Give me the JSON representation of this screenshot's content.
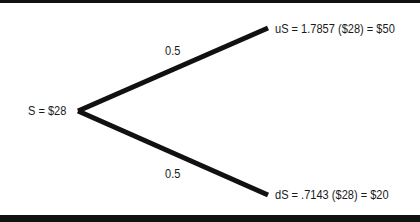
{
  "diagram": {
    "type": "binomial-tree",
    "root": {
      "label": "S = $28"
    },
    "branches": [
      {
        "name": "up",
        "probability": "0.5",
        "node_label": "uS = 1.7857 ($28) = $50"
      },
      {
        "name": "down",
        "probability": "0.5",
        "node_label": "dS = .7143 ($28) = $20"
      }
    ],
    "line_color": "#111111"
  }
}
